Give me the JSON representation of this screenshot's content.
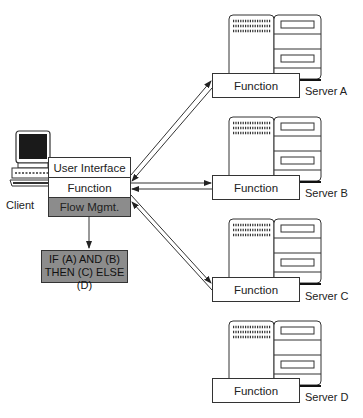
{
  "client": {
    "label": "Client",
    "stack": {
      "user_interface": "User Interface",
      "function": "Function",
      "flow_mgmt": "Flow Mgmt."
    },
    "condition": {
      "line1": "IF (A) AND (B)",
      "line2": "THEN (C) ELSE (D)"
    }
  },
  "servers": [
    {
      "name": "Server A",
      "function_label": "Function",
      "connected": true
    },
    {
      "name": "Server B",
      "function_label": "Function",
      "connected": true
    },
    {
      "name": "Server C",
      "function_label": "Function",
      "connected": true
    },
    {
      "name": "Server D",
      "function_label": "Function",
      "connected": false
    }
  ],
  "colors": {
    "line": "#333333",
    "shaded_box": "#8c8c8c",
    "monitor_screen": "#1a1a1a"
  }
}
